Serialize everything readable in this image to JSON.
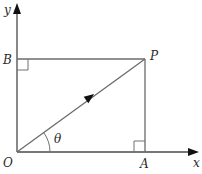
{
  "diagram": {
    "type": "vector-resolution",
    "axes": {
      "x_label": "x",
      "y_label": "y"
    },
    "points": {
      "origin": "O",
      "point_p": "P",
      "point_a": "A",
      "point_b": "B"
    },
    "angle_label": "θ",
    "vector": "OP",
    "right_angles": [
      "B",
      "A"
    ],
    "colors": {
      "line": "#6b6b6b",
      "axis": "#4a4a4a",
      "text": "#2a2a2a",
      "background": "#ffffff"
    }
  }
}
